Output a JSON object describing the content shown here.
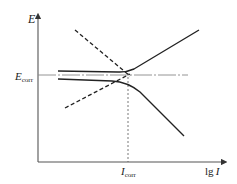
{
  "figure": {
    "type": "polarization-curve-diagram",
    "axes": {
      "y_label": "E",
      "x_label_prefix": "lg",
      "x_label_var": "I"
    },
    "markers": {
      "ecorr_main": "E",
      "ecorr_sub": "corr",
      "icorr_main": "I",
      "icorr_sub": "corr"
    },
    "curves": [
      {
        "name": "anodic-polarization-curve",
        "style": "solid",
        "description": "Upper solid line: horizontal then rising to upper right"
      },
      {
        "name": "cathodic-polarization-curve",
        "style": "solid",
        "description": "Lower solid line: slightly falling then dropping to lower right"
      },
      {
        "name": "cathodic-tafel-extrapolation",
        "style": "dashed",
        "description": "Dashed line descending from upper left to intersection"
      },
      {
        "name": "anodic-tafel-extrapolation",
        "style": "dashed",
        "description": "Dashed line rising from lower left to intersection"
      },
      {
        "name": "ecorr-reference-line",
        "style": "dash-dot",
        "description": "Horizontal line at E_corr"
      },
      {
        "name": "icorr-reference-line",
        "style": "dashed",
        "description": "Vertical line at I_corr"
      }
    ],
    "colors": {
      "line": "#222222",
      "reference": "#777777",
      "background": "#ffffff"
    }
  }
}
